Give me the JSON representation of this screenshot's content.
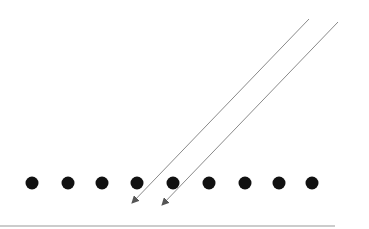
{
  "diagram": {
    "background": "#ffffff",
    "dots": {
      "color": "#111111",
      "radius": 6.5,
      "y": 183,
      "x": [
        32,
        68,
        102,
        137,
        173,
        209,
        245,
        279,
        312
      ]
    },
    "arrows": [
      {
        "x1": 309,
        "y1": 19,
        "x2": 132,
        "y2": 203,
        "color": "#8a8a8a"
      },
      {
        "x1": 338,
        "y1": 22,
        "x2": 162,
        "y2": 205,
        "color": "#8a8a8a"
      }
    ],
    "baseline": {
      "x1": 0,
      "y1": 226,
      "x2": 335,
      "y2": 226,
      "color": "#9a9a9a"
    }
  }
}
